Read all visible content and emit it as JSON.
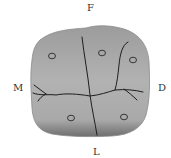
{
  "diagram": {
    "labels": {
      "top": "F",
      "left": "M",
      "right": "D",
      "bottom": "L"
    },
    "colors": {
      "surface": "#a8a8a8",
      "surface_light": "#bdbdbd",
      "shadow": "#7a7a7a",
      "groove": "#1e1e1e",
      "pit": "#2a2a2a"
    },
    "pits": [
      {
        "x": 52,
        "y": 56
      },
      {
        "x": 102,
        "y": 53
      },
      {
        "x": 133,
        "y": 60
      },
      {
        "x": 71,
        "y": 118
      },
      {
        "x": 124,
        "y": 117
      }
    ]
  }
}
